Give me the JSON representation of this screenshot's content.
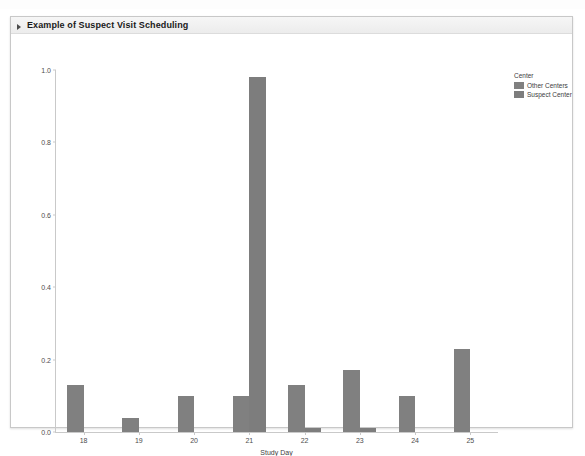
{
  "panel": {
    "title": "Example of Suspect Visit Scheduling",
    "disclosure_icon": "triangle-right-icon"
  },
  "legend": {
    "title": "Center",
    "items": [
      {
        "label": "Other Centers",
        "color": "#808080"
      },
      {
        "label": "Suspect Center",
        "color": "#7d7d7d"
      }
    ]
  },
  "chart_data": {
    "type": "bar",
    "title": "Example of Suspect Visit Scheduling",
    "xlabel": "Study Day",
    "ylabel": "",
    "grid": false,
    "legend_position": "right",
    "categories": [
      "18",
      "19",
      "20",
      "21",
      "22",
      "23",
      "24",
      "25"
    ],
    "x": [
      18,
      19,
      20,
      21,
      22,
      23,
      24,
      25
    ],
    "xlim": [
      17.5,
      25.5
    ],
    "ylim": [
      0.0,
      1.0
    ],
    "ytick_labels": [
      "0.0",
      "0.2",
      "0.4",
      "0.6",
      "0.8",
      "1.0"
    ],
    "ytick_values": [
      0.0,
      0.2,
      0.4,
      0.6,
      0.8,
      1.0
    ],
    "xtick_labels": [
      "18",
      "19",
      "20",
      "21",
      "22",
      "23",
      "24",
      "25"
    ],
    "series": [
      {
        "name": "Other Centers",
        "color": "#808080",
        "values": [
          0.13,
          0.04,
          0.1,
          0.1,
          0.13,
          0.17,
          0.1,
          0.23
        ]
      },
      {
        "name": "Suspect Center",
        "color": "#7d7d7d",
        "values": [
          0.0,
          0.0,
          0.0,
          0.98,
          0.01,
          0.01,
          0.0,
          0.0
        ]
      }
    ]
  }
}
